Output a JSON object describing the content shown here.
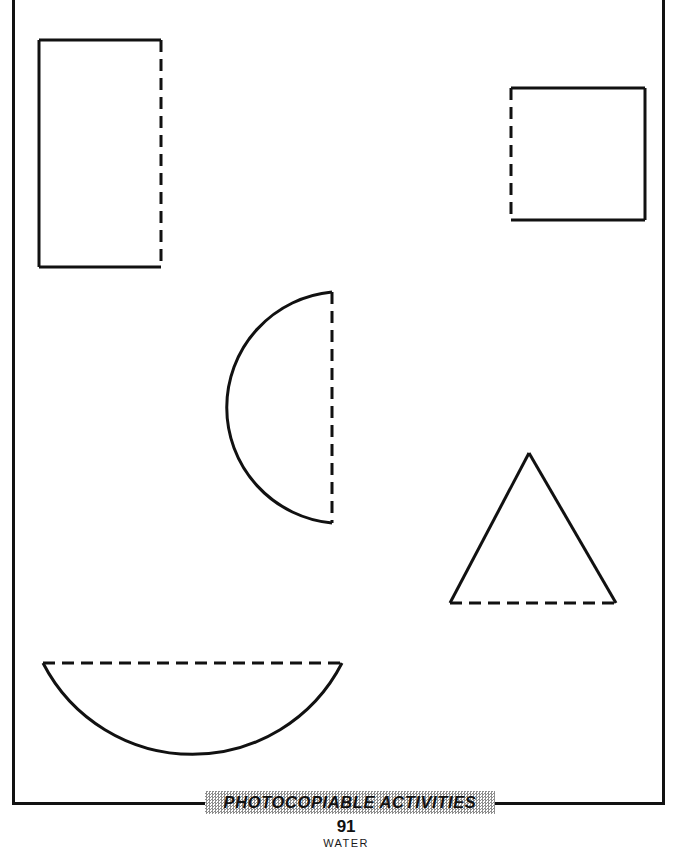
{
  "page": {
    "width": 692,
    "height": 865,
    "background_color": "#ffffff",
    "ink_color": "#111111",
    "frame": {
      "name": "worksheet-border",
      "x": 12,
      "y": -6,
      "width": 653,
      "height": 811,
      "stroke_width": 3
    }
  },
  "worksheet": {
    "title_hidden": true,
    "instruction_note": "",
    "shape_count": 5,
    "line_styles": {
      "solid": "solid outline edge",
      "dashed": "fold / mirror line"
    },
    "dash_pattern": {
      "dash": 12,
      "gap": 7
    }
  },
  "shapes": [
    {
      "name": "rectangle-half",
      "label": "rectangle",
      "type": "rectangle",
      "x": 39,
      "y": 40,
      "width": 122,
      "height": 227,
      "solid_edges": [
        "top",
        "left",
        "bottom"
      ],
      "dashed_edges": [
        "right"
      ]
    },
    {
      "name": "square-half",
      "label": "square",
      "type": "square",
      "x": 511,
      "y": 88,
      "width": 134,
      "height": 132,
      "solid_edges": [
        "top",
        "right",
        "bottom"
      ],
      "dashed_edges": [
        "left"
      ]
    },
    {
      "name": "semicircle-left-facing",
      "label": "semicircle",
      "type": "semicircle",
      "x": 222,
      "y": 292,
      "width": 110,
      "height": 231,
      "flat_edge": "right",
      "solid_edges": [
        "arc"
      ],
      "dashed_edges": [
        "right"
      ]
    },
    {
      "name": "triangle-half",
      "label": "triangle",
      "type": "triangle",
      "apex_x": 529,
      "apex_y": 453,
      "base_left_x": 450,
      "base_right_x": 616,
      "base_y": 603,
      "solid_edges": [
        "left",
        "right"
      ],
      "dashed_edges": [
        "bottom"
      ]
    },
    {
      "name": "semicircle-down-facing",
      "label": "semicircle",
      "type": "semicircle",
      "x": 43,
      "y": 663,
      "width": 299,
      "height": 102,
      "flat_edge": "top",
      "solid_edges": [
        "arc"
      ],
      "dashed_edges": [
        "top"
      ]
    }
  ],
  "footer": {
    "banner_text": "PHOTOCOPIABLE ACTIVITIES",
    "banner_fill": "#8e8e8e",
    "page_number": "91",
    "section_label": "WATER"
  }
}
